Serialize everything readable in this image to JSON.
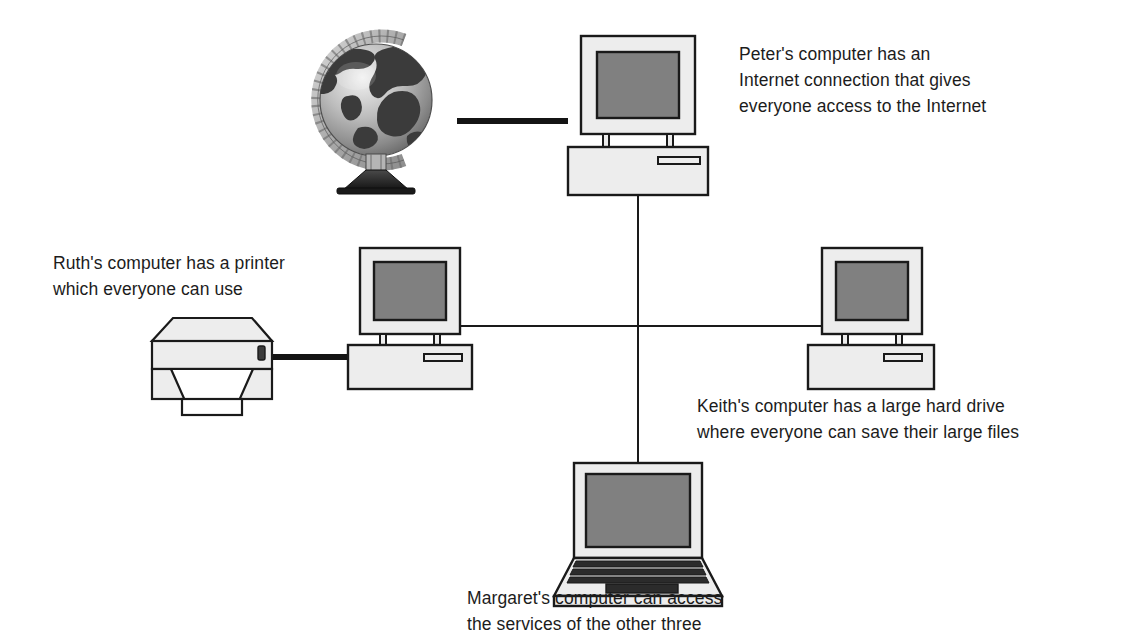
{
  "diagram": {
    "background_color": "#ffffff",
    "line_color": "#1a1a1a",
    "case_fill": "#ededed",
    "screen_fill": "#808080",
    "dark_fill": "#2b2b2b"
  },
  "captions": {
    "peter": "Peter's computer has an\nInternet connection that gives\neveryone access to the Internet",
    "ruth": "Ruth's computer has a printer\nwhich everyone can use",
    "keith": "Keith's computer has a large hard drive\nwhere everyone can save their large files",
    "margaret": "Margaret's computer can access\nthe services of the other three"
  },
  "nodes": [
    {
      "id": "globe",
      "label": "internet-globe",
      "type": "globe",
      "x": 310,
      "y": 30
    },
    {
      "id": "peter",
      "label": "peters-computer",
      "type": "desktop",
      "x": 568,
      "y": 36
    },
    {
      "id": "ruth",
      "label": "ruths-computer",
      "type": "desktop",
      "x": 340,
      "y": 248
    },
    {
      "id": "keith",
      "label": "keiths-computer",
      "type": "desktop",
      "x": 790,
      "y": 248
    },
    {
      "id": "margaret",
      "label": "margarets-computer",
      "type": "laptop",
      "x": 551,
      "y": 461
    },
    {
      "id": "printer",
      "label": "shared-printer",
      "type": "printer",
      "x": 152,
      "y": 318
    }
  ],
  "links": [
    {
      "id": "globe-to-peter",
      "from": "globe",
      "to": "peter",
      "style": "thick"
    },
    {
      "id": "printer-to-ruth",
      "from": "printer",
      "to": "ruth",
      "style": "thick"
    },
    {
      "id": "peter-to-bus",
      "from": "peter",
      "to": "bus",
      "style": "thin"
    },
    {
      "id": "ruth-to-keith-bus",
      "from": "ruth",
      "to": "keith",
      "style": "thin"
    },
    {
      "id": "bus-to-margaret",
      "from": "bus",
      "to": "margaret",
      "style": "thin"
    }
  ]
}
